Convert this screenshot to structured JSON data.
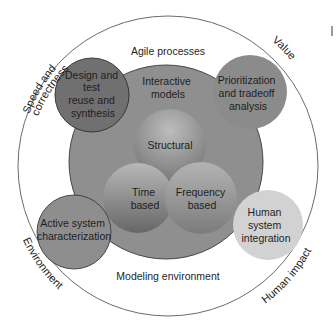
{
  "diagram": {
    "outer_ring": {
      "labels": {
        "top_left": "Speed and correctness",
        "top_left_line1": "Speed and",
        "top_left_line2": "correctness",
        "top_right": "Value",
        "bottom_left": "Environment",
        "bottom_right": "Human impact"
      },
      "inner_top_label": "Agile processes",
      "inner_bottom_label": "Modeling environment"
    },
    "central_circle": {
      "label_line1": "Interactive",
      "label_line2": "models",
      "color": "#8f8f8f"
    },
    "core_circles": [
      {
        "id": "structural",
        "lines": [
          "Structural"
        ]
      },
      {
        "id": "time",
        "lines": [
          "Time",
          "based"
        ]
      },
      {
        "id": "frequency",
        "lines": [
          "Frequency",
          "based"
        ]
      }
    ],
    "satellite_circles": [
      {
        "id": "design",
        "lines": [
          "Design and",
          "test",
          "reuse and",
          "synthesis"
        ],
        "color": "#707070"
      },
      {
        "id": "prioritization",
        "lines": [
          "Prioritization",
          "and tradeoff",
          "analysis"
        ],
        "color": "#8b8b8b"
      },
      {
        "id": "active",
        "lines": [
          "Active system",
          "characterization"
        ],
        "color": "#8e8e8e"
      },
      {
        "id": "human",
        "lines": [
          "Human",
          "system",
          "integration"
        ],
        "color": "#d2d2d2"
      }
    ]
  }
}
